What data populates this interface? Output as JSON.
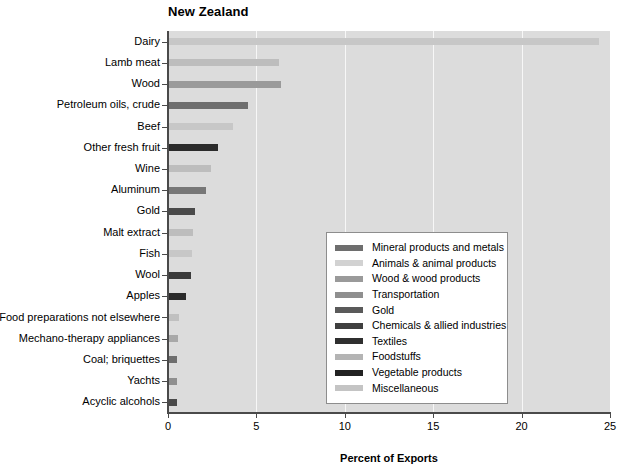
{
  "chart_data": {
    "type": "bar",
    "orientation": "horizontal",
    "title": "New Zealand",
    "xlabel": "Percent of Exports",
    "ylabel": "",
    "xlim": [
      0,
      25
    ],
    "xticks": [
      0,
      5,
      10,
      15,
      20,
      25
    ],
    "grid": true,
    "legend_position": "center-right",
    "plot_background": "#dcdcdc",
    "categories": [
      "Dairy",
      "Lamb meat",
      "Wood",
      "Petroleum oils, crude",
      "Beef",
      "Other fresh fruit",
      "Wine",
      "Aluminum",
      "Gold",
      "Malt extract",
      "Fish",
      "Wool",
      "Apples",
      "Food preparations not elsewhere",
      "Mechano-therapy appliances",
      "Coal; briquettes",
      "Yachts",
      "Acyclic alcohols"
    ],
    "values": [
      24.4,
      6.3,
      6.4,
      4.5,
      3.7,
      2.85,
      2.45,
      2.15,
      1.5,
      1.4,
      1.35,
      1.3,
      1.0,
      0.6,
      0.55,
      0.5,
      0.5,
      0.52
    ],
    "bar_colors": [
      "#c7c7c7",
      "#bdbdbd",
      "#9a9a9a",
      "#6e6e6e",
      "#c7c7c7",
      "#2b2b2b",
      "#bdbdbd",
      "#777777",
      "#4a4a4a",
      "#bdbdbd",
      "#c7c7c7",
      "#3a3a3a",
      "#2b2b2b",
      "#c0c0c0",
      "#a8a8a8",
      "#6e6e6e",
      "#8f8f8f",
      "#4a4a4a"
    ],
    "bar_categories": [
      "Animals & animal products",
      "Foodstuffs",
      "Wood & wood products",
      "Mineral products and metals",
      "Animals & animal products",
      "Vegetable products",
      "Foodstuffs",
      "Transportation",
      "Gold",
      "Foodstuffs",
      "Animals & animal products",
      "Textiles",
      "Vegetable products",
      "Foodstuffs",
      "Miscellaneous",
      "Mineral products and metals",
      "Transportation",
      "Chemicals & allied industries"
    ],
    "legend": [
      {
        "label": "Mineral products and metals",
        "color": "#6e6e6e"
      },
      {
        "label": "Animals & animal products",
        "color": "#d2d2d2"
      },
      {
        "label": "Wood & wood products",
        "color": "#9a9a9a"
      },
      {
        "label": "Transportation",
        "color": "#8f8f8f"
      },
      {
        "label": "Gold",
        "color": "#5a5a5a"
      },
      {
        "label": "Chemicals & allied industries",
        "color": "#3f3f3f"
      },
      {
        "label": "Textiles",
        "color": "#2f2f2f"
      },
      {
        "label": "Foodstuffs",
        "color": "#b4b4b4"
      },
      {
        "label": "Vegetable products",
        "color": "#222222"
      },
      {
        "label": "Miscellaneous",
        "color": "#c4c4c4"
      }
    ]
  }
}
